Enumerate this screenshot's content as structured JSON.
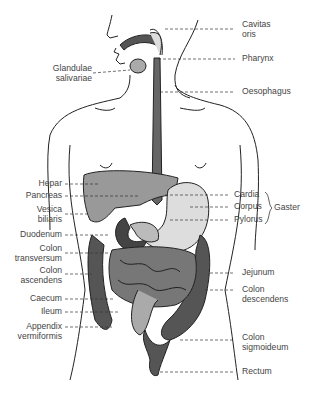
{
  "diagram": {
    "labels_left": [
      {
        "id": "glandulae",
        "text1": "Glandulae",
        "text2": "salivariae"
      },
      {
        "id": "hepar",
        "text1": "Hepar"
      },
      {
        "id": "pancreas",
        "text1": "Pancreas"
      },
      {
        "id": "vesica",
        "text1": "Vesica",
        "text2": "biliaris"
      },
      {
        "id": "duodenum",
        "text1": "Duodenum"
      },
      {
        "id": "colon_transversum",
        "text1": "Colon",
        "text2": "transversum"
      },
      {
        "id": "colon_ascendens",
        "text1": "Colon",
        "text2": "ascendens"
      },
      {
        "id": "caecum",
        "text1": "Caecum"
      },
      {
        "id": "ileum",
        "text1": "Ileum"
      },
      {
        "id": "appendix",
        "text1": "Appendix",
        "text2": "vermiformis"
      }
    ],
    "labels_right": [
      {
        "id": "cavitas",
        "text1": "Cavitas",
        "text2": "oris"
      },
      {
        "id": "pharynx",
        "text1": "Pharynx"
      },
      {
        "id": "oesophagus",
        "text1": "Oesophagus"
      },
      {
        "id": "cardia",
        "text1": "Cardia"
      },
      {
        "id": "corpus",
        "text1": "Corpus"
      },
      {
        "id": "pylorus",
        "text1": "Pylorus"
      },
      {
        "id": "gaster",
        "text1": "Gaster"
      },
      {
        "id": "jejunum",
        "text1": "Jejunum"
      },
      {
        "id": "colon_descendens",
        "text1": "Colon",
        "text2": "descendens"
      },
      {
        "id": "colon_sigmoideum",
        "text1": "Colon",
        "text2": "sigmoideum"
      },
      {
        "id": "rectum",
        "text1": "Rectum"
      }
    ]
  }
}
